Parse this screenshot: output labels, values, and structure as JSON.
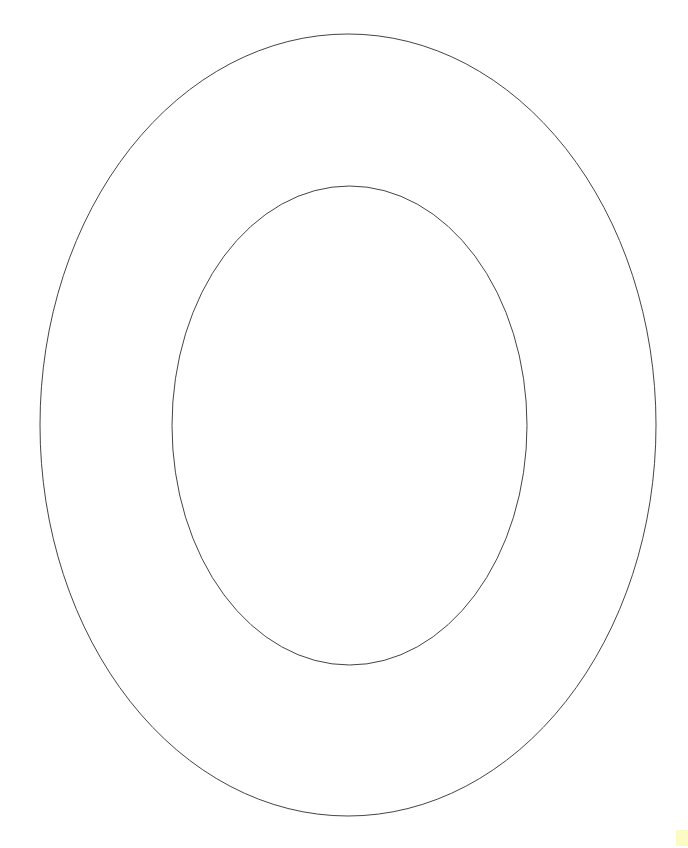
{
  "figure": {
    "background_color": "#ffffff",
    "stroke_color": "#444444",
    "outer_ellipse": {
      "cx": 348,
      "cy": 425,
      "rx": 308,
      "ry": 391
    },
    "inner_ellipse": {
      "cx": 349.5,
      "cy": 425.5,
      "rx": 177.5,
      "ry": 239.5
    }
  },
  "corner_mark": {
    "color": "#fdfbc4"
  }
}
